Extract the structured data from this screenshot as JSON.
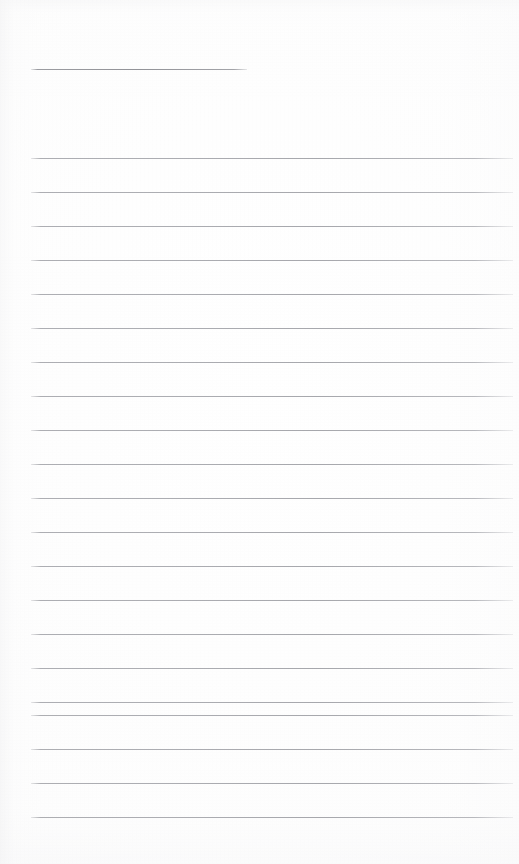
{
  "document": {
    "kind": "blank-ruled-notebook-page",
    "page_label": "",
    "has_text_content": false,
    "text_lines": [],
    "width_px": 519,
    "height_px": 864
  },
  "colors": {
    "paper": "#fdfdfd",
    "rule_line": "#acadb2",
    "title_rule": "#929398",
    "edge_shade": "#eaeaec"
  },
  "title_rule": {
    "name": "title-underline",
    "x": 31,
    "y": 69,
    "width": 216,
    "thickness": 1,
    "label_above": "",
    "label_below": ""
  },
  "ruling": {
    "first_line_y": 158,
    "line_spacing_px": 34,
    "line_count": 20,
    "left_margin_x": 31,
    "right_edge_x": 513,
    "line_width": 482,
    "thickness": 1
  },
  "rules": [
    {
      "index": 1,
      "y": 158,
      "content": ""
    },
    {
      "index": 2,
      "y": 192,
      "content": ""
    },
    {
      "index": 3,
      "y": 226,
      "content": ""
    },
    {
      "index": 4,
      "y": 260,
      "content": ""
    },
    {
      "index": 5,
      "y": 294,
      "content": ""
    },
    {
      "index": 6,
      "y": 328,
      "content": ""
    },
    {
      "index": 7,
      "y": 362,
      "content": ""
    },
    {
      "index": 8,
      "y": 396,
      "content": ""
    },
    {
      "index": 9,
      "y": 430,
      "content": ""
    },
    {
      "index": 10,
      "y": 464,
      "content": ""
    },
    {
      "index": 11,
      "y": 498,
      "content": ""
    },
    {
      "index": 12,
      "y": 532,
      "content": ""
    },
    {
      "index": 13,
      "y": 566,
      "content": ""
    },
    {
      "index": 14,
      "y": 600,
      "content": ""
    },
    {
      "index": 15,
      "y": 634,
      "content": ""
    },
    {
      "index": 16,
      "y": 668,
      "content": ""
    },
    {
      "index": 17,
      "y": 702,
      "content": ""
    },
    {
      "index": 18,
      "y": 715,
      "content": ""
    },
    {
      "index": 19,
      "y": 749,
      "content": ""
    },
    {
      "index": 20,
      "y": 783,
      "content": ""
    },
    {
      "index": 21,
      "y": 817,
      "content": ""
    }
  ]
}
